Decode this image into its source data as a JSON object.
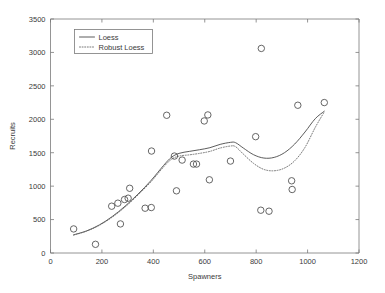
{
  "chart_data": {
    "type": "scatter",
    "title": "",
    "xlabel": "Spawners",
    "ylabel": "Recruits",
    "xlim": [
      0,
      1200
    ],
    "ylim": [
      0,
      3500
    ],
    "xticks": [
      0,
      200,
      400,
      600,
      800,
      1000,
      1200
    ],
    "yticks": [
      0,
      500,
      1000,
      1500,
      2000,
      2500,
      3000,
      3500
    ],
    "xtick_labels": [
      "0",
      "200",
      "400",
      "600",
      "800",
      "1000",
      "1200"
    ],
    "ytick_labels": [
      "0",
      "500",
      "1000",
      "1500",
      "2000",
      "2500",
      "3000",
      "3500"
    ],
    "grid": false,
    "legend_position": "upper left",
    "legend": [
      {
        "label": "Loess",
        "style": "solid"
      },
      {
        "label": "Robust Loess",
        "style": "dotted"
      }
    ],
    "marker": {
      "shape": "circle",
      "filled": false,
      "size": 5
    },
    "points": [
      {
        "x": 90,
        "y": 360
      },
      {
        "x": 175,
        "y": 130
      },
      {
        "x": 238,
        "y": 700
      },
      {
        "x": 262,
        "y": 745
      },
      {
        "x": 272,
        "y": 435
      },
      {
        "x": 288,
        "y": 800
      },
      {
        "x": 302,
        "y": 820
      },
      {
        "x": 308,
        "y": 968
      },
      {
        "x": 368,
        "y": 670
      },
      {
        "x": 392,
        "y": 680
      },
      {
        "x": 393,
        "y": 1525
      },
      {
        "x": 452,
        "y": 2060
      },
      {
        "x": 482,
        "y": 1450
      },
      {
        "x": 490,
        "y": 930
      },
      {
        "x": 512,
        "y": 1390
      },
      {
        "x": 556,
        "y": 1330
      },
      {
        "x": 568,
        "y": 1330
      },
      {
        "x": 598,
        "y": 1975
      },
      {
        "x": 612,
        "y": 2065
      },
      {
        "x": 618,
        "y": 1095
      },
      {
        "x": 700,
        "y": 1375
      },
      {
        "x": 798,
        "y": 1740
      },
      {
        "x": 820,
        "y": 3060
      },
      {
        "x": 818,
        "y": 640
      },
      {
        "x": 850,
        "y": 625
      },
      {
        "x": 938,
        "y": 1080
      },
      {
        "x": 940,
        "y": 950
      },
      {
        "x": 962,
        "y": 2210
      },
      {
        "x": 1065,
        "y": 2250
      }
    ],
    "series": [
      {
        "name": "Loess",
        "style": "solid",
        "x": [
          90,
          140,
          190,
          240,
          290,
          340,
          390,
          440,
          470,
          500,
          540,
          580,
          620,
          660,
          700,
          720,
          750,
          790,
          830,
          870,
          910,
          950,
          990,
          1030,
          1065
        ],
        "y": [
          272,
          330,
          420,
          545,
          700,
          880,
          1080,
          1310,
          1430,
          1490,
          1520,
          1545,
          1575,
          1625,
          1655,
          1650,
          1570,
          1470,
          1420,
          1430,
          1500,
          1630,
          1810,
          2010,
          2120
        ]
      },
      {
        "name": "Robust Loess",
        "style": "dotted",
        "x": [
          90,
          140,
          190,
          240,
          290,
          340,
          390,
          440,
          470,
          500,
          540,
          580,
          620,
          660,
          700,
          720,
          750,
          790,
          830,
          870,
          910,
          950,
          990,
          1030,
          1065
        ],
        "y": [
          268,
          326,
          414,
          536,
          688,
          866,
          1062,
          1288,
          1400,
          1450,
          1468,
          1490,
          1520,
          1570,
          1600,
          1590,
          1480,
          1340,
          1250,
          1230,
          1270,
          1380,
          1580,
          1880,
          2110
        ]
      }
    ]
  },
  "axes": {
    "xlabel": "Spawners",
    "ylabel": "Recruits"
  }
}
